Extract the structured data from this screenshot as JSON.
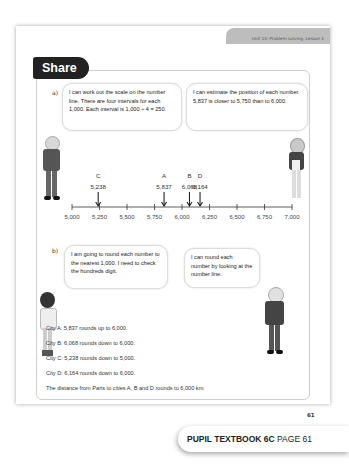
{
  "header": {
    "unit_banner": "Unit 14: Problem solving, Lesson 1",
    "section_title": "Share"
  },
  "part_a": {
    "label": "a)",
    "bubble_left": "I can work out the scale on the number line. There are four intervals for each 1,000. Each interval is 1,000 ÷ 4 = 250.",
    "bubble_right": "I can estimate the position of each number. 5,837 is closer to 5,750 than to 6,000.",
    "number_line": {
      "min": 5000,
      "max": 7000,
      "tick_labels": [
        "5,000",
        "5,250",
        "5,500",
        "5,750",
        "6,000",
        "6,250",
        "6,500",
        "6,750",
        "7,000"
      ],
      "markers": [
        {
          "letter": "C",
          "value_label": "5,238",
          "value": 5238
        },
        {
          "letter": "A",
          "value_label": "5,837",
          "value": 5837
        },
        {
          "letter": "B",
          "value_label": "6,068",
          "value": 6068
        },
        {
          "letter": "D",
          "value_label": "6,164",
          "value": 6164
        }
      ]
    }
  },
  "part_b": {
    "label": "b)",
    "bubble_left": "I am going to round each number to the nearest 1,000. I need to check the hundreds digit.",
    "bubble_right": "I can round each number by looking at the number line.",
    "lines": [
      "City A: 5,837 rounds up to 6,000.",
      "City B: 6,068 rounds down to 6,000.",
      "City C: 5,238 rounds down to 5,000.",
      "City D: 6,164 rounds down to 6,000.",
      "The distance from Paris to cities A, B and D rounds to 6,000 km."
    ]
  },
  "page_number": "61",
  "footer": {
    "book": "PUPIL TEXTBOOK 6C",
    "page": "PAGE 61"
  }
}
